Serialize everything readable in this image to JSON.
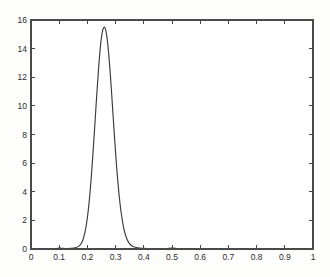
{
  "chart_data": {
    "type": "line",
    "title": "",
    "subtitle": "",
    "xlabel": "",
    "ylabel": "",
    "xlim": [
      0,
      1
    ],
    "ylim": [
      0,
      16
    ],
    "grid": false,
    "legend": false,
    "legend_position": "none",
    "box": true,
    "tick_direction": "in",
    "line_color": "#3a3a3a",
    "axis_color": "#4a4a4a",
    "background_color": "#ffffff",
    "xticks": [
      0,
      0.1,
      0.2,
      0.3,
      0.4,
      0.5,
      0.6,
      0.7,
      0.8,
      0.9,
      1
    ],
    "xtick_labels": [
      "0",
      "0.1",
      "0.2",
      "0.3",
      "0.4",
      "0.5",
      "0.6",
      "0.7",
      "0.8",
      "0.9",
      "1"
    ],
    "yticks": [
      0,
      2,
      4,
      6,
      8,
      10,
      12,
      14,
      16
    ],
    "ytick_labels": [
      "0",
      "2",
      "4",
      "6",
      "8",
      "10",
      "12",
      "14",
      "16"
    ],
    "annotations": [],
    "peak": {
      "x": 0.25,
      "y": 15.5
    },
    "series": [
      {
        "name": "density",
        "x": [
          0.0,
          0.02,
          0.04,
          0.06,
          0.08,
          0.1,
          0.11,
          0.12,
          0.13,
          0.14,
          0.15,
          0.16,
          0.17,
          0.175,
          0.18,
          0.185,
          0.19,
          0.195,
          0.2,
          0.205,
          0.21,
          0.215,
          0.22,
          0.225,
          0.23,
          0.235,
          0.24,
          0.245,
          0.25,
          0.255,
          0.26,
          0.265,
          0.27,
          0.275,
          0.28,
          0.285,
          0.29,
          0.295,
          0.3,
          0.305,
          0.31,
          0.315,
          0.32,
          0.33,
          0.34,
          0.35,
          0.36,
          0.37,
          0.38,
          0.39,
          0.4,
          0.42,
          0.44,
          0.46,
          0.48,
          0.5,
          0.52,
          0.54,
          0.56,
          0.6,
          0.65,
          0.7,
          0.75,
          0.8,
          0.85,
          0.9,
          0.95,
          1.0
        ],
        "y": [
          0.0,
          0.0,
          0.0,
          0.0,
          0.01,
          0.06,
          0.05,
          0.03,
          0.03,
          0.04,
          0.06,
          0.1,
          0.2,
          0.3,
          0.45,
          0.7,
          1.05,
          1.55,
          2.2,
          3.05,
          4.1,
          5.35,
          6.75,
          8.25,
          9.8,
          11.3,
          12.7,
          13.9,
          14.8,
          15.35,
          15.5,
          15.3,
          14.7,
          13.75,
          12.55,
          11.15,
          9.65,
          8.15,
          6.7,
          5.4,
          4.25,
          3.3,
          2.5,
          1.35,
          0.7,
          0.36,
          0.2,
          0.12,
          0.08,
          0.05,
          0.04,
          0.03,
          0.02,
          0.02,
          0.03,
          0.06,
          0.03,
          0.02,
          0.01,
          0.01,
          0.01,
          0.01,
          0.01,
          0.01,
          0.01,
          0.01,
          0.0,
          0.0
        ]
      }
    ]
  },
  "plot_geometry": {
    "left": 31,
    "right": 313,
    "top": 20,
    "bottom": 249
  }
}
